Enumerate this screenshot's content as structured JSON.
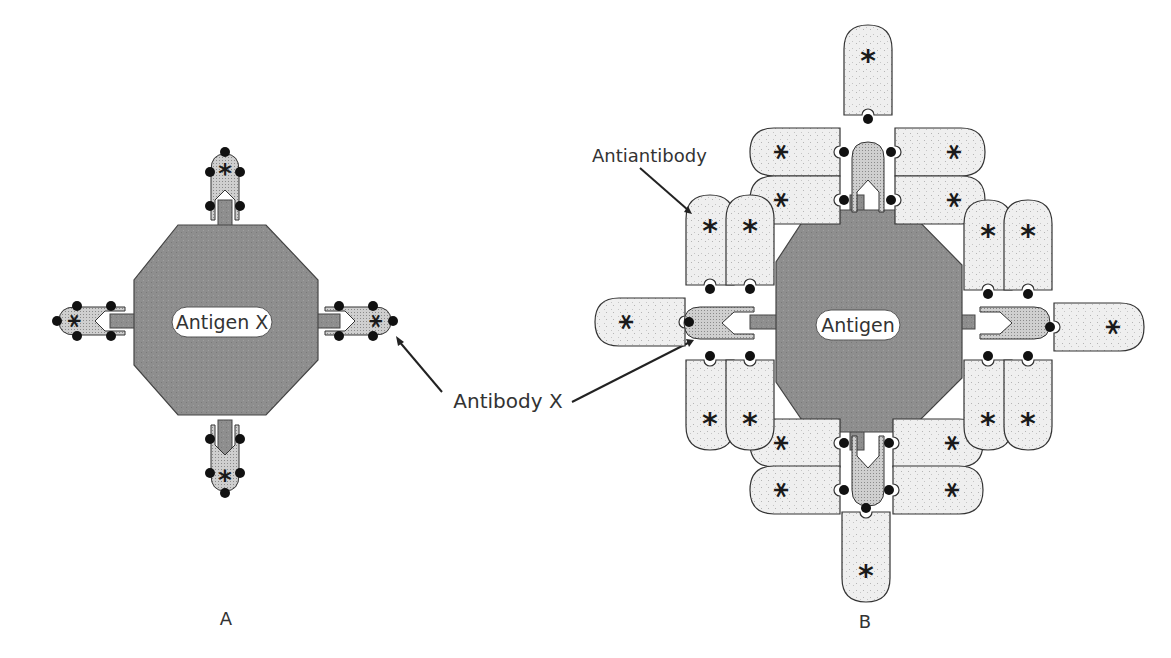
{
  "figure": {
    "panel_a": {
      "caption": "A",
      "antigen_label": "Antigen X",
      "antibody_count": 4,
      "callout": "Antibody X"
    },
    "panel_b": {
      "caption": "B",
      "antigen_label": "Antigen",
      "antibody_count": 4,
      "antiantibody_count": 20,
      "callout_antiantibody": "Antiantibody"
    },
    "shared_callout": "Antibody X",
    "marker_symbol": "*",
    "colors": {
      "antigen_fill": "#8f8f8f",
      "antibody_fill": "#c9c9c9",
      "antiantibody_fill": "#ededed",
      "outline": "#333333",
      "dot": "#111111"
    }
  }
}
